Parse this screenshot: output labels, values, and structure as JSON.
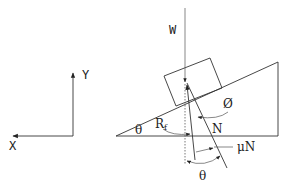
{
  "diagram": {
    "title": "",
    "type": "free-body diagram of block on inclined plane with friction",
    "colors": {
      "line": "#333333",
      "text": "#222222",
      "background": "#ffffff"
    },
    "axes": {
      "y_label": "Y",
      "x_label": "X"
    },
    "labels": {
      "weight": "W",
      "incline_angle": "θ",
      "friction_angle": "Ø",
      "resultant": "R",
      "resultant_sub": "f",
      "normal": "N",
      "friction": "μN",
      "bottom_angle": "θ"
    }
  }
}
